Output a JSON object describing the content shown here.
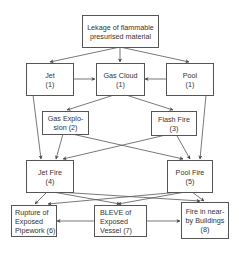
{
  "diagram": {
    "title": "Lekage of flammable presurised material",
    "nodes": [
      {
        "id": "leak",
        "lines": [
          "Lekage of flammable",
          "presurised material"
        ]
      },
      {
        "id": "jet",
        "lines": [
          "Jet",
          "(1)"
        ]
      },
      {
        "id": "gas_cloud",
        "lines": [
          "Gas Cloud",
          "(1)"
        ]
      },
      {
        "id": "pool",
        "lines": [
          "Pool",
          "(1)"
        ]
      },
      {
        "id": "gas_explosion",
        "lines": [
          "Gas Explo-",
          "sion (2)"
        ]
      },
      {
        "id": "flash_fire",
        "lines": [
          "Flash Fire",
          "(3)"
        ]
      },
      {
        "id": "jet_fire",
        "lines": [
          "Jet Fire",
          "(4)"
        ]
      },
      {
        "id": "pool_fire",
        "lines": [
          "Pool Fire",
          "(5)"
        ]
      },
      {
        "id": "rupture",
        "lines": [
          "Rupture of",
          "Exposed",
          "Pipework (6)"
        ]
      },
      {
        "id": "bleve",
        "lines": [
          "BLEVE of",
          "Exposed",
          "Vessel (7)"
        ]
      },
      {
        "id": "fire_buildings",
        "lines": [
          "Fire in near-",
          "by Buildings",
          "(8)"
        ]
      }
    ],
    "edges": [
      {
        "from": "leak",
        "to": "jet"
      },
      {
        "from": "leak",
        "to": "gas_cloud"
      },
      {
        "from": "leak",
        "to": "pool"
      },
      {
        "from": "jet",
        "to": "gas_cloud"
      },
      {
        "from": "pool",
        "to": "gas_cloud"
      },
      {
        "from": "gas_cloud",
        "to": "gas_explosion"
      },
      {
        "from": "gas_cloud",
        "to": "flash_fire"
      },
      {
        "from": "jet",
        "to": "jet_fire"
      },
      {
        "from": "pool",
        "to": "pool_fire"
      },
      {
        "from": "gas_explosion",
        "to": "jet_fire"
      },
      {
        "from": "gas_explosion",
        "to": "pool_fire"
      },
      {
        "from": "flash_fire",
        "to": "jet_fire"
      },
      {
        "from": "flash_fire",
        "to": "pool_fire"
      },
      {
        "from": "jet_fire",
        "to": "rupture"
      },
      {
        "from": "jet_fire",
        "to": "bleve"
      },
      {
        "from": "jet_fire",
        "to": "fire_buildings"
      },
      {
        "from": "pool_fire",
        "to": "rupture"
      },
      {
        "from": "pool_fire",
        "to": "bleve"
      },
      {
        "from": "pool_fire",
        "to": "fire_buildings"
      },
      {
        "from": "bleve",
        "to": "rupture"
      },
      {
        "from": "bleve",
        "to": "fire_buildings"
      }
    ],
    "colors": {
      "line": "#555555",
      "text": "#333333",
      "background": "#ffffff"
    }
  }
}
